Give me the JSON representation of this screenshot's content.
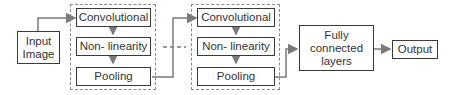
{
  "diagram": {
    "input": {
      "label": "Input Image"
    },
    "blocks": [
      {
        "layers": [
          "Convolutional",
          "Non- linearity",
          "Pooling"
        ]
      },
      {
        "layers": [
          "Convolutional",
          "Non- linearity",
          "Pooling"
        ]
      }
    ],
    "fully_connected": {
      "label": "Fully connected layers"
    },
    "output": {
      "label": "Output"
    },
    "colors": {
      "stroke": "#3a3a3a",
      "arrow": "#7a7a7a",
      "dashed": "#8a8a8a"
    }
  }
}
